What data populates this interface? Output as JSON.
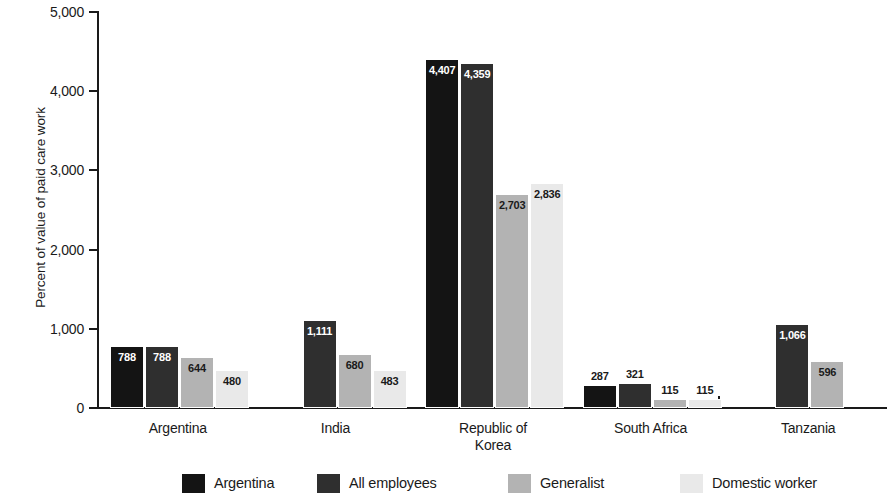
{
  "chart_data": {
    "type": "bar",
    "title": "",
    "xlabel": "",
    "ylabel": "Percent of value of paid care work",
    "ylim": [
      0,
      5000
    ],
    "ytick_labels": [
      "0",
      "1,000",
      "2,000",
      "3,000",
      "4,000",
      "5,000"
    ],
    "ytick_values": [
      0,
      1000,
      2000,
      3000,
      4000,
      5000
    ],
    "grid": false,
    "legend_position": "bottom",
    "categories": [
      "Argentina",
      "India",
      "Republic of\nKorea",
      "South Africa",
      "Tanzania"
    ],
    "category_lines": [
      [
        "Argentina"
      ],
      [
        "India"
      ],
      [
        "Republic of",
        "Korea"
      ],
      [
        "South Africa"
      ],
      [
        "Tanzania"
      ]
    ],
    "series": [
      {
        "name": "Argentina",
        "color": "#141414",
        "values": [
          788,
          null,
          4407,
          287,
          null
        ],
        "labels": [
          "788",
          null,
          "4,407",
          "287",
          null
        ]
      },
      {
        "name": "All employees",
        "color": "#2f2f2f",
        "values": [
          788,
          1111,
          4359,
          321,
          1066
        ],
        "labels": [
          "788",
          "1,111",
          "4,359",
          "321",
          "1,066"
        ]
      },
      {
        "name": "Generalist",
        "color": "#b3b3b3",
        "values": [
          644,
          680,
          2703,
          115,
          596
        ],
        "labels": [
          "644",
          "680",
          "2,703",
          "115",
          "596"
        ]
      },
      {
        "name": "Domestic worker",
        "color": "#e9e9e9",
        "values": [
          480,
          483,
          2836,
          115,
          null
        ],
        "labels": [
          "480",
          "483",
          "2,836",
          "115",
          null
        ]
      }
    ]
  },
  "legend": {
    "items": [
      {
        "label": "Argentina",
        "color": "#141414"
      },
      {
        "label": "All employees",
        "color": "#2f2f2f"
      },
      {
        "label": "Generalist",
        "color": "#b3b3b3"
      },
      {
        "label": "Domestic worker",
        "color": "#e9e9e9"
      }
    ]
  }
}
